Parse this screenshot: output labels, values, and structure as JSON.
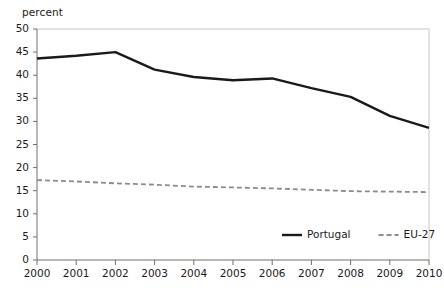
{
  "chart_data": {
    "type": "line",
    "title": "",
    "subtitle": "",
    "xlabel": "",
    "ylabel": "percent",
    "unit_label": "percent",
    "categories": [
      "2000",
      "2001",
      "2002",
      "2003",
      "2004",
      "2005",
      "2006",
      "2007",
      "2008",
      "2009",
      "2010"
    ],
    "x": [
      2000,
      2001,
      2002,
      2003,
      2004,
      2005,
      2006,
      2007,
      2008,
      2009,
      2010
    ],
    "xlim": [
      2000,
      2010
    ],
    "ylim": [
      0,
      50
    ],
    "y_ticks": [
      0,
      5,
      10,
      15,
      20,
      25,
      30,
      35,
      40,
      45,
      50
    ],
    "y_tick_labels": [
      "0",
      "5",
      "10",
      "15",
      "20",
      "25",
      "30",
      "35",
      "40",
      "45",
      "50"
    ],
    "grid": false,
    "legend_position": "bottom-right",
    "series": [
      {
        "name": "Portugal",
        "style": "solid",
        "color": "#1a1a1a",
        "width": 2.4,
        "values": [
          43.6,
          44.2,
          45.0,
          41.2,
          39.6,
          38.9,
          39.3,
          37.2,
          35.3,
          31.2,
          28.6
        ]
      },
      {
        "name": "EU-27",
        "style": "dashed",
        "color": "#8c8c8c",
        "width": 1.8,
        "values": [
          17.3,
          17.0,
          16.6,
          16.3,
          15.9,
          15.7,
          15.5,
          15.2,
          14.9,
          14.8,
          14.7
        ]
      }
    ],
    "legend": [
      {
        "label": "Portugal",
        "style": "solid",
        "color": "#1a1a1a"
      },
      {
        "label": "EU-27",
        "style": "dashed",
        "color": "#8c8c8c"
      }
    ],
    "colors": {
      "portugal": "#1a1a1a",
      "eu27": "#8c8c8c",
      "axis": "#6e6e6e",
      "frame": "#c8c8c8",
      "background": "#ffffff"
    }
  }
}
